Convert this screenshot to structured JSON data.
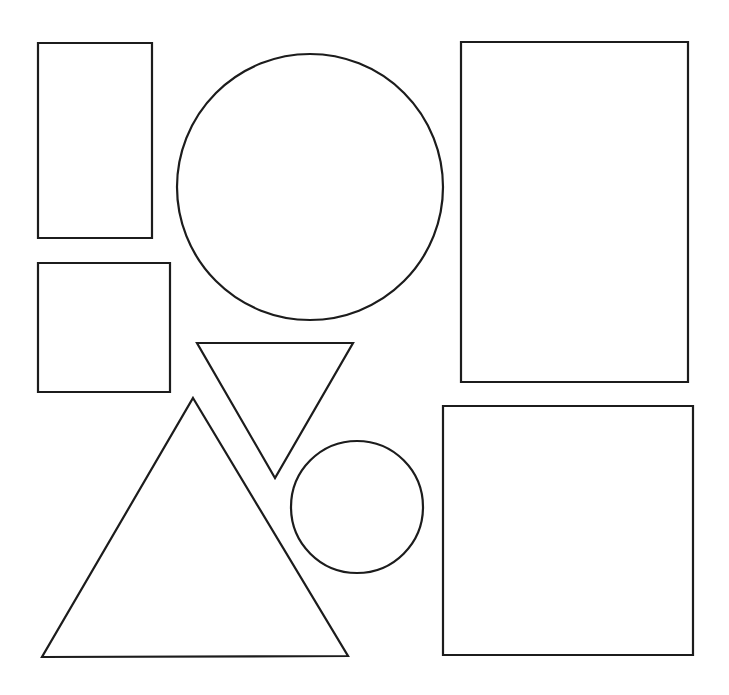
{
  "page": {
    "width": 729,
    "height": 695,
    "background_color": "#ffffff",
    "stroke_color": "#1c1c1c",
    "stroke_width": 2.2,
    "fill": "none",
    "shape_count": 7
  },
  "shapes": [
    {
      "id": "rect-tall-top-left",
      "name": "tall-rectangle",
      "type": "rectangle",
      "x": 38,
      "y": 43,
      "width": 114,
      "height": 195,
      "points": "38,43 152,43 152,238 38,238"
    },
    {
      "id": "rect-square-left",
      "name": "small-square",
      "type": "rectangle",
      "x": 38,
      "y": 263,
      "width": 132,
      "height": 129,
      "points": "38,263 170,263 170,392 38,392"
    },
    {
      "id": "circle-large",
      "name": "large-circle",
      "type": "circle",
      "cx": 310,
      "cy": 187,
      "r": 133
    },
    {
      "id": "circle-small",
      "name": "small-circle",
      "type": "circle",
      "cx": 357,
      "cy": 507,
      "r": 66
    },
    {
      "id": "triangle-down",
      "name": "inverted-triangle",
      "type": "triangle",
      "orientation": "pointing-down",
      "points": "197,343 353,343 275,478"
    },
    {
      "id": "triangle-up",
      "name": "large-triangle",
      "type": "triangle",
      "orientation": "pointing-up",
      "points": "193,398 348,656 42,657"
    },
    {
      "id": "rect-tall-right",
      "name": "large-portrait-rectangle",
      "type": "rectangle",
      "x": 461,
      "y": 42,
      "width": 227,
      "height": 340,
      "points": "461,42 688,42 688,382 461,382"
    },
    {
      "id": "rect-square-right",
      "name": "large-square",
      "type": "rectangle",
      "x": 443,
      "y": 406,
      "width": 250,
      "height": 249,
      "points": "443,406 693,406 693,655 443,655"
    }
  ]
}
